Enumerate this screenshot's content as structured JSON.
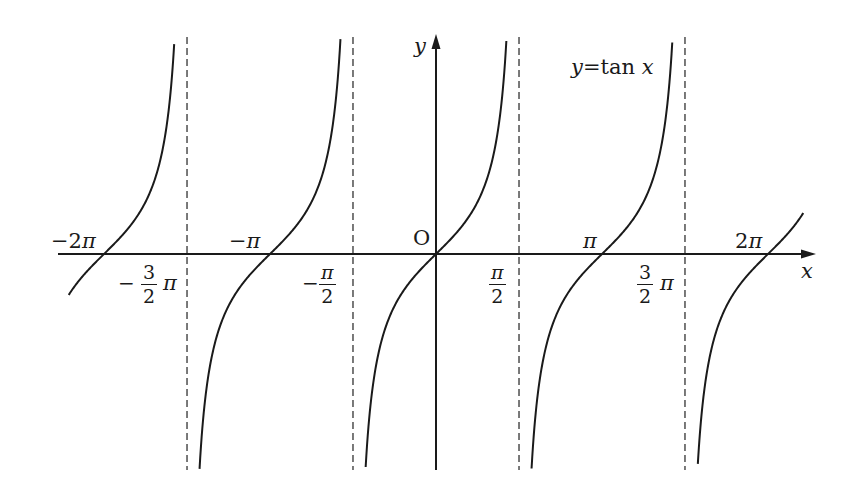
{
  "chart_data": {
    "type": "line",
    "title": "y=tan x",
    "function": "tan",
    "xlabel": "x",
    "ylabel": "y",
    "origin_label": "O",
    "xlim": [
      -6.9,
      7.3
    ],
    "ylim": [
      -4.1,
      4.1
    ],
    "grid": false,
    "legend_position": "top-right (inline label)",
    "colors": {
      "curve": "#1a1a1a",
      "axis": "#1a1a1a",
      "asymptote": "#333333",
      "background": "#ffffff"
    },
    "asymptotes": [
      {
        "x": -4.712,
        "label_num": "3",
        "label_den": "2",
        "label_sign": "−",
        "label_suffix": "π"
      },
      {
        "x": -1.571,
        "label_num": "π",
        "label_den": "2",
        "label_sign": "−",
        "label_suffix": ""
      },
      {
        "x": 1.571,
        "label_num": "π",
        "label_den": "2",
        "label_sign": "",
        "label_suffix": ""
      },
      {
        "x": 4.712,
        "label_num": "3",
        "label_den": "2",
        "label_sign": "",
        "label_suffix": "π"
      }
    ],
    "zeros": [
      {
        "x": -6.283,
        "label": "−2π"
      },
      {
        "x": -3.142,
        "label": "−π"
      },
      {
        "x": 0,
        "label": "O"
      },
      {
        "x": 3.142,
        "label": "π"
      },
      {
        "x": 6.283,
        "label": "2π"
      }
    ],
    "branches": [
      {
        "x_start": -6.95,
        "x_end": -4.83
      },
      {
        "x_start": -4.58,
        "x_end": -1.69
      },
      {
        "x_start": -1.45,
        "x_end": 1.45
      },
      {
        "x_start": 1.69,
        "x_end": 4.59
      },
      {
        "x_start": 4.83,
        "x_end": 6.95
      }
    ],
    "x_ticks": [
      "−2π",
      "−3/2π",
      "−π",
      "−π/2",
      "0",
      "π/2",
      "π",
      "3/2π",
      "2π"
    ]
  },
  "labels": {
    "y_axis": "y",
    "x_axis": "x",
    "origin": "O",
    "equation_y": "y",
    "equation_eq": "=",
    "equation_fn": "tan",
    "equation_x": "x",
    "neg_2pi": "−2π",
    "neg_pi": "−π",
    "pi": "π",
    "two_pi": "2π",
    "minus": "−",
    "three": "3",
    "two": "2",
    "pi_sym": "π"
  }
}
